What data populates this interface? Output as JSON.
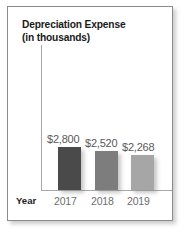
{
  "chart_data": {
    "type": "bar",
    "title": "Depreciation Expense",
    "subtitle": "(in thousands)",
    "xlabel": "Year",
    "ylabel": "",
    "grid": false,
    "legend": false,
    "axis_line_color": "#a8a8a8",
    "categories": [
      "2017",
      "2018",
      "2019"
    ],
    "values": [
      2800,
      2520,
      2268
    ],
    "value_labels": [
      "$2,800",
      "$2,520",
      "$2,268"
    ],
    "bar_colors": [
      "#4a4a4a",
      "#7d7d7d",
      "#a6a6a6"
    ],
    "ylim": [
      0,
      2800
    ],
    "units": "thousands of dollars",
    "currency_symbol": "$"
  },
  "panel": {
    "border_color": "#8b8b8b",
    "background": "#ffffff"
  },
  "title": {
    "line1": "Depreciation Expense",
    "line2": "(in thousands)",
    "color": "#1a1a1a"
  },
  "axis": {
    "x_title": "Year",
    "label_color": "#6e6e6e",
    "categories": [
      {
        "label": "2017"
      },
      {
        "label": "2018"
      },
      {
        "label": "2019"
      }
    ]
  },
  "series": [
    {
      "category": "2017",
      "value": 2800,
      "label": "$2,800",
      "color": "#4a4a4a"
    },
    {
      "category": "2018",
      "value": 2520,
      "label": "$2,520",
      "color": "#7d7d7d"
    },
    {
      "category": "2019",
      "value": 2268,
      "label": "$2,268",
      "color": "#a6a6a6"
    }
  ]
}
